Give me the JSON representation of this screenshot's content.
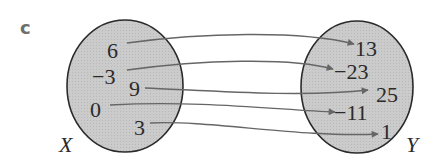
{
  "label": "c",
  "domain_set": {
    "name": "X",
    "values": [
      "6",
      "−3",
      "9",
      "0",
      "3"
    ]
  },
  "codomain_set": {
    "name": "Y",
    "values": [
      "13",
      "−23",
      "25",
      "−11",
      "1"
    ]
  },
  "mapping": [
    {
      "from": "6",
      "to": "13"
    },
    {
      "from": "−3",
      "to": "−23"
    },
    {
      "from": "9",
      "to": "25"
    },
    {
      "from": "0",
      "to": "−11"
    },
    {
      "from": "3",
      "to": "1"
    }
  ],
  "colors": {
    "set_fill": "#c9c9c9",
    "set_stroke": "#2a2a2a",
    "arrow": "#666666",
    "label_c": "#6e6e6e"
  }
}
